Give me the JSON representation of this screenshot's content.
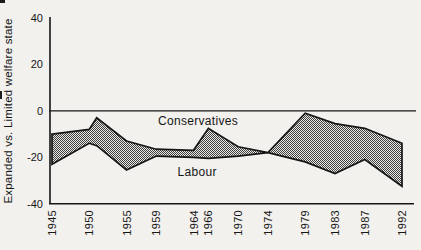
{
  "figure": {
    "background": "#f2f1ee",
    "ink": "#161616",
    "band_fill_dark": "#3f3f3f",
    "band_fill_light": "#eae9e6"
  },
  "chart_data": {
    "type": "area",
    "title": "",
    "xlabel": "",
    "ylabel": "Expanded vs. Limited welfare state",
    "ylim": [
      -40,
      40
    ],
    "yticks": [
      40,
      20,
      0,
      -20,
      -40
    ],
    "xlim": [
      1945,
      1992
    ],
    "x": [
      1945,
      1950,
      1951,
      1955,
      1959,
      1964,
      1966,
      1970,
      1974,
      1979,
      1983,
      1987,
      1992
    ],
    "x_tick_labels": [
      "1945",
      "1950",
      "1955",
      "1959",
      "1964",
      "1966",
      "1970",
      "1974",
      "1979",
      "1983",
      "1987",
      "1992"
    ],
    "series": [
      {
        "name": "Conservatives",
        "values": [
          -10,
          -8,
          -3,
          -13,
          -16.5,
          -17,
          -7.5,
          -15.5,
          -18,
          -1,
          -5.5,
          -7.5,
          -14
        ]
      },
      {
        "name": "Labour",
        "values": [
          -23,
          -14,
          -15,
          -25.5,
          -19.5,
          -20,
          -20.5,
          -19.5,
          -18,
          -22,
          -27,
          -21,
          -32.5
        ]
      }
    ],
    "fill_between": "halftone-hatch",
    "zero_line": true,
    "grid": false,
    "legend_position": "inline-labels",
    "annotations": [
      {
        "text": "Conservatives",
        "x": 1964.6,
        "y": -4.2
      },
      {
        "text": "Labour",
        "x": 1964.5,
        "y": -26.5
      }
    ]
  }
}
